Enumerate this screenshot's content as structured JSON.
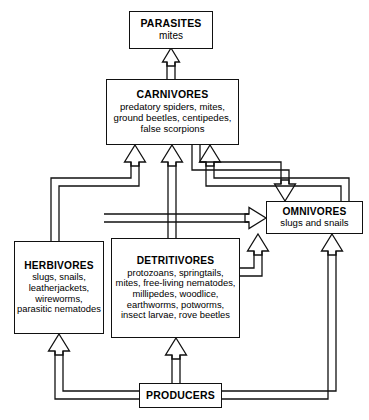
{
  "diagram": {
    "type": "flow-diagram",
    "line_color": "#111111",
    "background": "#ffffff",
    "arrow_style": "hollow-outline-arrow"
  },
  "nodes": [
    {
      "id": "parasites",
      "title": "PARASITES",
      "members": "mites",
      "trophic_level": "parasites"
    },
    {
      "id": "carnivores",
      "title": "CARNIVORES",
      "members": "predatory spiders, mites, ground beetles, centipedes, false scorpions",
      "trophic_level": "secondary-consumers"
    },
    {
      "id": "omnivores",
      "title": "OMNIVORES",
      "members": "slugs and snails",
      "trophic_level": "omnivores"
    },
    {
      "id": "herbivores",
      "title": "HERBIVORES",
      "members": "slugs, snails, leatherjackets, wireworms, parasitic nematodes",
      "trophic_level": "primary-consumers"
    },
    {
      "id": "detritivores",
      "title": "DETRITIVORES",
      "members": "protozoans, springtails, mites, free-living nematodes, millipedes, woodlice, earthworms, potworms, insect larvae, rove beetles",
      "trophic_level": "decomposers"
    },
    {
      "id": "producers",
      "title": "PRODUCERS",
      "members": "",
      "trophic_level": "producers"
    }
  ],
  "edges": [
    {
      "id": "carnivores-to-parasites",
      "from": "carnivores",
      "to": "parasites"
    },
    {
      "id": "herbivores-to-carnivores",
      "from": "herbivores",
      "to": "carnivores"
    },
    {
      "id": "detritivores-to-carnivores",
      "from": "detritivores",
      "to": "carnivores"
    },
    {
      "id": "omnivores-to-carnivores",
      "from": "omnivores",
      "to": "carnivores"
    },
    {
      "id": "carnivores-to-omnivores",
      "from": "carnivores",
      "to": "omnivores"
    },
    {
      "id": "herbivores-to-omnivores",
      "from": "herbivores",
      "to": "omnivores"
    },
    {
      "id": "detritivores-to-omnivores",
      "from": "detritivores",
      "to": "omnivores"
    },
    {
      "id": "producers-to-omnivores",
      "from": "producers",
      "to": "omnivores"
    },
    {
      "id": "producers-to-herbivores",
      "from": "producers",
      "to": "herbivores"
    },
    {
      "id": "producers-to-detritivores",
      "from": "producers",
      "to": "detritivores"
    }
  ]
}
